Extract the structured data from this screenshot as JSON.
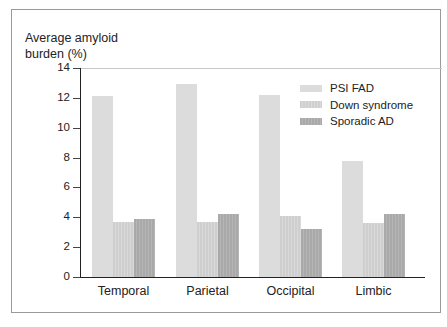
{
  "chart_data": {
    "type": "bar",
    "title": "",
    "ylabel": "Average amyloid burden (%)",
    "ylabel_lines": [
      "Average amyloid",
      "burden (%)"
    ],
    "xlabel": "",
    "ylim": [
      0,
      14
    ],
    "yticks": [
      0,
      2,
      4,
      6,
      8,
      10,
      12,
      14
    ],
    "categories": [
      "Temporal",
      "Parietal",
      "Occipital",
      "Limbic"
    ],
    "series": [
      {
        "name": "PSI FAD",
        "color": "#dcdcdc",
        "values": [
          12.1,
          12.9,
          12.2,
          7.8
        ]
      },
      {
        "name": "Down syndrome",
        "color": "#d2d2d2",
        "values": [
          3.7,
          3.7,
          4.1,
          3.6
        ]
      },
      {
        "name": "Sporadic AD",
        "color": "#ababab",
        "values": [
          3.9,
          4.2,
          3.2,
          4.2
        ]
      }
    ],
    "grid": false,
    "legend_position": "upper right"
  }
}
